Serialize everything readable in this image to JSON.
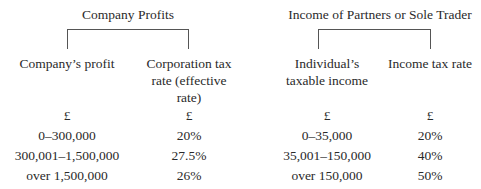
{
  "company": {
    "title": "Company Profits",
    "col1_header": "Company’s profit",
    "col2_header_lines": [
      "Corporation tax",
      "rate (effective",
      "rate)"
    ],
    "unit1": "£",
    "unit2": "£",
    "rows": [
      {
        "band": "0–300,000",
        "rate": "20%"
      },
      {
        "band": "300,001–1,500,000",
        "rate": "27.5%"
      },
      {
        "band": "over 1,500,000",
        "rate": "26%"
      }
    ]
  },
  "individual": {
    "title": "Income of Partners or Sole Trader",
    "col1_header_lines": [
      "Individual’s",
      "taxable income"
    ],
    "col2_header": "Income tax rate",
    "unit1": "£",
    "unit2": "£",
    "rows": [
      {
        "band": "0–35,000",
        "rate": "20%"
      },
      {
        "band": "35,001–150,000",
        "rate": "40%"
      },
      {
        "band": "over 150,000",
        "rate": "50%"
      }
    ]
  }
}
